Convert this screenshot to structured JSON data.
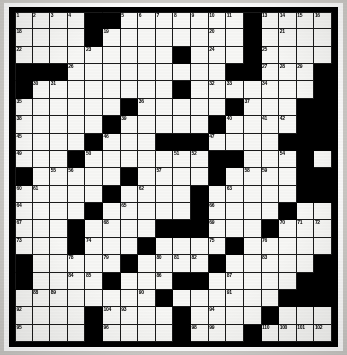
{
  "puzzle": {
    "type": "crossword-grid",
    "columns": 18,
    "rows": 19,
    "total_cells": 342,
    "max_clue_number": 110,
    "colors": {
      "open_cell": "#f7f7f5",
      "block_cell": "#000000",
      "grid_line": "#1a1a1a",
      "frame": "#000000",
      "page": "#ffffff"
    },
    "blocks": [
      [
        0,
        4
      ],
      [
        0,
        5
      ],
      [
        0,
        13
      ],
      [
        1,
        4
      ],
      [
        1,
        13
      ],
      [
        2,
        9
      ],
      [
        2,
        13
      ],
      [
        3,
        0
      ],
      [
        3,
        1
      ],
      [
        3,
        2
      ],
      [
        3,
        12
      ],
      [
        3,
        13
      ],
      [
        3,
        17
      ],
      [
        4,
        0
      ],
      [
        4,
        9
      ],
      [
        4,
        17
      ],
      [
        5,
        6
      ],
      [
        5,
        12
      ],
      [
        5,
        16
      ],
      [
        5,
        17
      ],
      [
        6,
        5
      ],
      [
        6,
        11
      ],
      [
        6,
        16
      ],
      [
        6,
        17
      ],
      [
        7,
        4
      ],
      [
        7,
        8
      ],
      [
        7,
        9
      ],
      [
        7,
        10
      ],
      [
        7,
        15
      ],
      [
        7,
        16
      ],
      [
        7,
        17
      ],
      [
        8,
        3
      ],
      [
        8,
        11
      ],
      [
        8,
        12
      ],
      [
        8,
        16
      ],
      [
        9,
        0
      ],
      [
        9,
        6
      ],
      [
        9,
        11
      ],
      [
        9,
        16
      ],
      [
        9,
        17
      ],
      [
        10,
        5
      ],
      [
        10,
        10
      ],
      [
        10,
        16
      ],
      [
        10,
        17
      ],
      [
        11,
        4
      ],
      [
        11,
        10
      ],
      [
        11,
        15
      ],
      [
        12,
        3
      ],
      [
        12,
        8
      ],
      [
        12,
        9
      ],
      [
        12,
        10
      ],
      [
        12,
        14
      ],
      [
        13,
        3
      ],
      [
        13,
        7
      ],
      [
        13,
        12
      ],
      [
        14,
        0
      ],
      [
        14,
        6
      ],
      [
        14,
        11
      ],
      [
        14,
        17
      ],
      [
        15,
        0
      ],
      [
        15,
        5
      ],
      [
        15,
        9
      ],
      [
        15,
        10
      ],
      [
        15,
        16
      ],
      [
        15,
        17
      ],
      [
        16,
        8
      ],
      [
        16,
        15
      ],
      [
        16,
        16
      ],
      [
        16,
        17
      ],
      [
        17,
        4
      ],
      [
        17,
        9
      ],
      [
        17,
        14
      ],
      [
        18,
        4
      ],
      [
        18,
        9
      ],
      [
        18,
        13
      ]
    ],
    "numbers": [
      {
        "n": 1,
        "r": 0,
        "c": 0
      },
      {
        "n": 2,
        "r": 0,
        "c": 1
      },
      {
        "n": 3,
        "r": 0,
        "c": 2
      },
      {
        "n": 4,
        "r": 0,
        "c": 3
      },
      {
        "n": 5,
        "r": 0,
        "c": 6
      },
      {
        "n": 6,
        "r": 0,
        "c": 7
      },
      {
        "n": 7,
        "r": 0,
        "c": 8
      },
      {
        "n": 8,
        "r": 0,
        "c": 9
      },
      {
        "n": 9,
        "r": 0,
        "c": 10
      },
      {
        "n": 10,
        "r": 0,
        "c": 11
      },
      {
        "n": 11,
        "r": 0,
        "c": 12
      },
      {
        "n": 12,
        "r": 0,
        "c": 13
      },
      {
        "n": 13,
        "r": 0,
        "c": 14
      },
      {
        "n": 14,
        "r": 0,
        "c": 15
      },
      {
        "n": 15,
        "r": 0,
        "c": 16
      },
      {
        "n": 16,
        "r": 0,
        "c": 17
      },
      {
        "n": 17,
        "r": 0,
        "c": 17
      },
      {
        "n": 18,
        "r": 1,
        "c": 0
      },
      {
        "n": 19,
        "r": 1,
        "c": 5
      },
      {
        "n": 20,
        "r": 1,
        "c": 11
      },
      {
        "n": 21,
        "r": 1,
        "c": 15
      },
      {
        "n": 22,
        "r": 2,
        "c": 0
      },
      {
        "n": 23,
        "r": 2,
        "c": 4
      },
      {
        "n": 24,
        "r": 2,
        "c": 11
      },
      {
        "n": 25,
        "r": 2,
        "c": 14
      },
      {
        "n": 26,
        "r": 3,
        "c": 3
      },
      {
        "n": 27,
        "r": 3,
        "c": 14
      },
      {
        "n": 28,
        "r": 3,
        "c": 15
      },
      {
        "n": 29,
        "r": 3,
        "c": 16
      },
      {
        "n": 30,
        "r": 4,
        "c": 1
      },
      {
        "n": 31,
        "r": 4,
        "c": 2
      },
      {
        "n": 32,
        "r": 4,
        "c": 11
      },
      {
        "n": 33,
        "r": 4,
        "c": 12
      },
      {
        "n": 34,
        "r": 4,
        "c": 14
      },
      {
        "n": 35,
        "r": 5,
        "c": 0
      },
      {
        "n": 36,
        "r": 5,
        "c": 7
      },
      {
        "n": 37,
        "r": 5,
        "c": 13
      },
      {
        "n": 38,
        "r": 6,
        "c": 0
      },
      {
        "n": 39,
        "r": 6,
        "c": 6
      },
      {
        "n": 40,
        "r": 6,
        "c": 12
      },
      {
        "n": 41,
        "r": 6,
        "c": 14
      },
      {
        "n": 42,
        "r": 6,
        "c": 15
      },
      {
        "n": 43,
        "r": 6,
        "c": 16
      },
      {
        "n": 44,
        "r": 6,
        "c": 17
      },
      {
        "n": 45,
        "r": 7,
        "c": 0
      },
      {
        "n": 46,
        "r": 7,
        "c": 5
      },
      {
        "n": 47,
        "r": 7,
        "c": 11
      },
      {
        "n": 48,
        "r": 7,
        "c": 15
      },
      {
        "n": 49,
        "r": 8,
        "c": 0
      },
      {
        "n": 50,
        "r": 8,
        "c": 4
      },
      {
        "n": 51,
        "r": 8,
        "c": 9
      },
      {
        "n": 52,
        "r": 8,
        "c": 10
      },
      {
        "n": 53,
        "r": 8,
        "c": 11
      },
      {
        "n": 54,
        "r": 8,
        "c": 15
      },
      {
        "n": 55,
        "r": 9,
        "c": 2
      },
      {
        "n": 56,
        "r": 9,
        "c": 3
      },
      {
        "n": 57,
        "r": 9,
        "c": 8
      },
      {
        "n": 58,
        "r": 9,
        "c": 13
      },
      {
        "n": 59,
        "r": 9,
        "c": 14
      },
      {
        "n": 60,
        "r": 10,
        "c": 0
      },
      {
        "n": 61,
        "r": 10,
        "c": 1
      },
      {
        "n": 62,
        "r": 10,
        "c": 7
      },
      {
        "n": 63,
        "r": 10,
        "c": 12
      },
      {
        "n": 64,
        "r": 11,
        "c": 0
      },
      {
        "n": 65,
        "r": 11,
        "c": 6
      },
      {
        "n": 66,
        "r": 11,
        "c": 11
      },
      {
        "n": 67,
        "r": 12,
        "c": 0
      },
      {
        "n": 68,
        "r": 12,
        "c": 5
      },
      {
        "n": 69,
        "r": 12,
        "c": 11
      },
      {
        "n": 70,
        "r": 12,
        "c": 15
      },
      {
        "n": 71,
        "r": 12,
        "c": 16
      },
      {
        "n": 72,
        "r": 12,
        "c": 17
      },
      {
        "n": 73,
        "r": 13,
        "c": 0
      },
      {
        "n": 74,
        "r": 13,
        "c": 4
      },
      {
        "n": 75,
        "r": 13,
        "c": 11
      },
      {
        "n": 76,
        "r": 13,
        "c": 14
      },
      {
        "n": 77,
        "r": 14,
        "c": 0
      },
      {
        "n": 78,
        "r": 14,
        "c": 3
      },
      {
        "n": 79,
        "r": 14,
        "c": 5
      },
      {
        "n": 80,
        "r": 14,
        "c": 8
      },
      {
        "n": 81,
        "r": 14,
        "c": 9
      },
      {
        "n": 82,
        "r": 14,
        "c": 10
      },
      {
        "n": 83,
        "r": 14,
        "c": 14
      },
      {
        "n": 84,
        "r": 15,
        "c": 3
      },
      {
        "n": 85,
        "r": 15,
        "c": 4
      },
      {
        "n": 86,
        "r": 15,
        "c": 8
      },
      {
        "n": 87,
        "r": 15,
        "c": 12
      },
      {
        "n": 88,
        "r": 16,
        "c": 1
      },
      {
        "n": 89,
        "r": 16,
        "c": 2
      },
      {
        "n": 90,
        "r": 16,
        "c": 7
      },
      {
        "n": 91,
        "r": 16,
        "c": 12
      },
      {
        "n": 92,
        "r": 17,
        "c": 0
      },
      {
        "n": 93,
        "r": 17,
        "c": 6
      },
      {
        "n": 94,
        "r": 17,
        "c": 11
      },
      {
        "n": 95,
        "r": 18,
        "c": 0
      },
      {
        "n": 96,
        "r": 18,
        "c": 5
      },
      {
        "n": 97,
        "r": 18,
        "c": 9
      },
      {
        "n": 98,
        "r": 18,
        "c": 10
      },
      {
        "n": 99,
        "r": 18,
        "c": 11
      },
      {
        "n": 100,
        "r": 18,
        "c": 15
      },
      {
        "n": 101,
        "r": 18,
        "c": 16
      },
      {
        "n": 102,
        "r": 18,
        "c": 17
      },
      {
        "n": 103,
        "r": 19,
        "c": 0
      },
      {
        "n": 104,
        "r": 19,
        "c": 5
      },
      {
        "n": 105,
        "r": 19,
        "c": 9
      },
      {
        "n": 106,
        "r": 19,
        "c": 14
      },
      {
        "n": 107,
        "r": 20,
        "c": 0
      },
      {
        "n": 108,
        "r": 20,
        "c": 5
      },
      {
        "n": 109,
        "r": 20,
        "c": 9
      },
      {
        "n": 110,
        "r": 20,
        "c": 14
      }
    ]
  }
}
